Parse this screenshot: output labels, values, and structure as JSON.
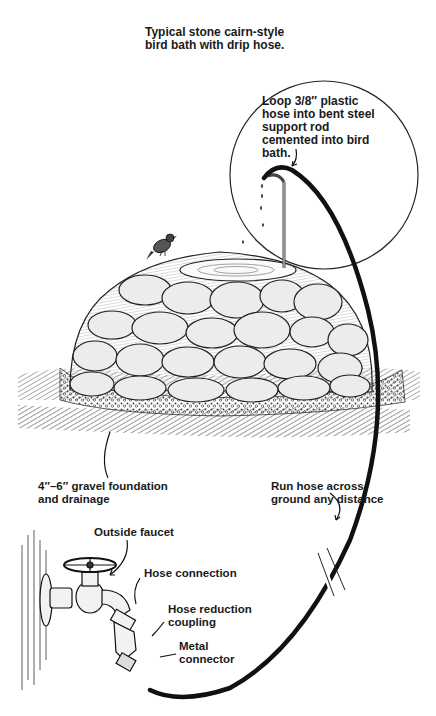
{
  "title": "Typical stone cairn-style\nbird bath with drip hose.",
  "labels": {
    "loop": "Loop 3/8″ plastic\nhose into bent steel\nsupport rod\ncemented into bird\nbath.",
    "gravel": "4″–6″ gravel foundation\nand drainage",
    "run_hose": "Run hose across\nground any distance",
    "outside_faucet": "Outside faucet",
    "hose_connection": "Hose connection",
    "hose_reduction": "Hose reduction\ncoupling",
    "metal_connector": "Metal\nconnector"
  },
  "icons": {
    "bird": "bird-icon",
    "cairn": "stone-cairn",
    "faucet": "faucet-icon",
    "hose": "drip-hose"
  },
  "colors": {
    "ink": "#1a1a1a",
    "stone_fill": "#e6e6e6",
    "paper": "#ffffff"
  }
}
